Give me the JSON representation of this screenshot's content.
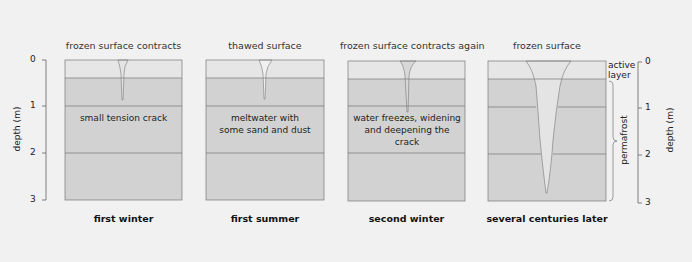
{
  "panels": [
    {
      "title": "frozen surface contracts",
      "label": "small tension crack",
      "caption": "first winter"
    },
    {
      "title": "thawed surface",
      "label": "meltwater with some sand and dust",
      "caption": "first summer"
    },
    {
      "title": "frozen surface contracts again",
      "label": "water freezes, widening and deepening the crack",
      "caption": "second winter"
    },
    {
      "title": "frozen surface",
      "label": "",
      "caption": "several centuries later"
    }
  ],
  "axis_left": {
    "label": "depth (m)",
    "ticks": [
      "0",
      "1",
      "2",
      "3"
    ]
  },
  "axis_right": {
    "label": "depth (m)",
    "ticks": [
      "0",
      "1",
      "2",
      "3"
    ]
  },
  "annotations": {
    "active_layer_1": "active",
    "active_layer_2": "layer",
    "permafrost": "permafrost"
  },
  "colors": {
    "background": "#f1f1f1",
    "active_layer": "#e6e6e6",
    "permafrost": "#d2d2d2",
    "crack": "#e4e4e4",
    "line": "#777777"
  }
}
